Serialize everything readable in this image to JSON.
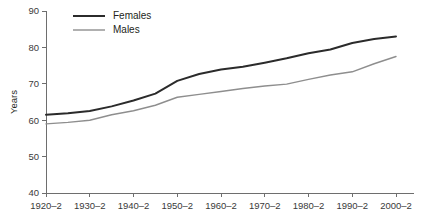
{
  "chart_data": {
    "type": "line",
    "title": "",
    "subtitle": "",
    "xlabel": "",
    "ylabel": "Years",
    "grid": false,
    "legend_position": "top-left",
    "categories": [
      "1920–2",
      "1930–2",
      "1940–2",
      "1950–2",
      "1960–2",
      "1970–2",
      "1980–2",
      "1990–2",
      "2000–2"
    ],
    "x": [
      1920,
      1930,
      1940,
      1950,
      1960,
      1970,
      1980,
      1990,
      2000
    ],
    "xlim": [
      1920,
      2000
    ],
    "ylim": [
      40,
      90
    ],
    "yticks": [
      40,
      50,
      60,
      70,
      80,
      90
    ],
    "ytick_labels": [
      "40",
      "50",
      "60",
      "70",
      "80",
      "90"
    ],
    "series": [
      {
        "name": "Females",
        "color": "#2b2b2b",
        "line_width": 2.0,
        "x": [
          1920,
          1925,
          1930,
          1935,
          1940,
          1945,
          1950,
          1955,
          1960,
          1965,
          1970,
          1975,
          1980,
          1985,
          1990,
          1995,
          2000
        ],
        "values": [
          61.5,
          61.9,
          62.5,
          63.8,
          65.4,
          67.3,
          70.8,
          72.7,
          73.9,
          74.7,
          75.8,
          77.0,
          78.4,
          79.4,
          81.2,
          82.3,
          83.0
        ]
      },
      {
        "name": "Males",
        "color": "#8e8e8e",
        "line_width": 1.4,
        "x": [
          1920,
          1925,
          1930,
          1935,
          1940,
          1945,
          1950,
          1955,
          1960,
          1965,
          1970,
          1975,
          1980,
          1985,
          1990,
          1995,
          2000
        ],
        "values": [
          59.0,
          59.4,
          60.0,
          61.5,
          62.6,
          64.1,
          66.3,
          67.1,
          67.9,
          68.7,
          69.4,
          69.9,
          71.2,
          72.4,
          73.3,
          75.5,
          77.5
        ]
      }
    ]
  },
  "legend": {
    "items": [
      {
        "label": "Females",
        "color": "#2b2b2b",
        "line_width": 2.0
      },
      {
        "label": "Males",
        "color": "#8e8e8e",
        "line_width": 1.4
      }
    ]
  },
  "axes": {
    "y_title": "Years",
    "axis_color": "#6e6e6e"
  }
}
